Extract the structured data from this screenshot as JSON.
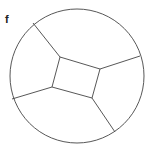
{
  "panel_label": "f",
  "diagram": {
    "type": "circle-partition",
    "circle": {
      "cx": 77,
      "cy": 76,
      "r": 67
    },
    "center_quad": [
      [
        60,
        57
      ],
      [
        100,
        69
      ],
      [
        92,
        98
      ],
      [
        52,
        87
      ]
    ],
    "spokes": [
      {
        "from": [
          60,
          57
        ],
        "to": [
          33,
          23
        ]
      },
      {
        "from": [
          100,
          69
        ],
        "to": [
          140,
          56
        ]
      },
      {
        "from": [
          92,
          98
        ],
        "to": [
          115,
          132
        ]
      },
      {
        "from": [
          52,
          87
        ],
        "to": [
          12,
          99
        ]
      }
    ],
    "stroke": "#444444"
  }
}
